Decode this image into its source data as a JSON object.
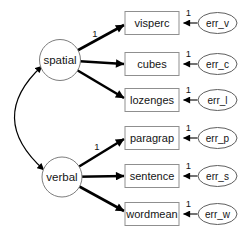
{
  "diagram": {
    "type": "sem-path-diagram",
    "latents": [
      {
        "label": "spatial"
      },
      {
        "label": "verbal"
      }
    ],
    "observed": [
      {
        "label": "visperc",
        "error_label": "err_v",
        "error_weight": "1"
      },
      {
        "label": "cubes",
        "error_label": "err_c",
        "error_weight": "1"
      },
      {
        "label": "lozenges",
        "error_label": "err_l",
        "error_weight": "1"
      },
      {
        "label": "paragrap",
        "error_label": "err_p",
        "error_weight": "1"
      },
      {
        "label": "sentence",
        "error_label": "err_s",
        "error_weight": "1"
      },
      {
        "label": "wordmean",
        "error_label": "err_w",
        "error_weight": "1"
      }
    ],
    "loading_weights": {
      "spatial_visperc": "1",
      "verbal_paragrap": "1"
    },
    "covariance": {
      "between": "spatial-verbal",
      "style": "curved-double-headed"
    },
    "colors": {
      "background": "#ffffff",
      "arrow": "#000000",
      "box_border": "#8f8f8f",
      "ellipse_border": "#5f5f5f",
      "circle_border": "#7d7d7d",
      "text": "#141414"
    }
  }
}
